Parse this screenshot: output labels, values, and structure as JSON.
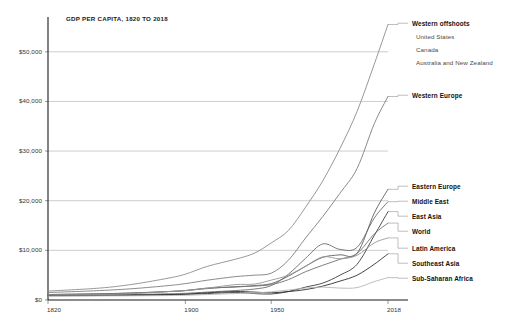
{
  "chart_data": {
    "type": "line",
    "title": "GDP PER CAPITA, 1820 TO 2018",
    "xlabel": "",
    "ylabel": "",
    "grid": true,
    "legend_position": "right",
    "xlim": [
      1820,
      2018
    ],
    "ylim": [
      0,
      56000
    ],
    "x_ticks": [
      1820,
      1900,
      1950,
      2018
    ],
    "x_tick_labels": [
      "1820",
      "1900",
      "1950",
      "2018"
    ],
    "y_ticks": [
      0,
      10000,
      20000,
      30000,
      40000,
      50000
    ],
    "y_tick_labels": [
      "$0",
      "$10,000",
      "$20,000",
      "$30,000",
      "$40,000",
      "$50,000"
    ],
    "x": [
      1820,
      1850,
      1870,
      1890,
      1900,
      1913,
      1929,
      1940,
      1950,
      1960,
      1970,
      1980,
      1990,
      2000,
      2010,
      2018
    ],
    "series": [
      {
        "name": "Western offshoots",
        "color": "#8c8c8c",
        "values": [
          1800,
          2400,
          3200,
          4400,
          5200,
          6800,
          8200,
          9400,
          11500,
          14000,
          18700,
          24000,
          30500,
          38000,
          47500,
          55500
        ]
      },
      {
        "name": "Western Europe",
        "color": "#7d7d7d",
        "values": [
          1500,
          1900,
          2300,
          2900,
          3300,
          4000,
          4700,
          5000,
          5400,
          8000,
          12500,
          16800,
          21500,
          26500,
          35500,
          41000
        ]
      },
      {
        "name": "Eastern Europe",
        "color": "#5f5f5f",
        "values": [
          1100,
          1250,
          1400,
          1700,
          1900,
          2400,
          2600,
          2900,
          3300,
          4800,
          6800,
          8600,
          9100,
          9400,
          17500,
          22300
        ]
      },
      {
        "name": "Middle East",
        "color": "#6b6b6b",
        "values": [
          900,
          1000,
          1100,
          1250,
          1350,
          1600,
          1900,
          2200,
          2900,
          5200,
          8400,
          11300,
          10200,
          10600,
          16500,
          19800
        ]
      },
      {
        "name": "East Asia",
        "color": "#3c3c3c",
        "values": [
          950,
          1000,
          1000,
          1100,
          1150,
          1300,
          1500,
          1300,
          1200,
          1700,
          2600,
          3400,
          5000,
          7200,
          13000,
          17800
        ]
      },
      {
        "name": "World",
        "color": "#707070",
        "values": [
          1100,
          1250,
          1450,
          1700,
          1900,
          2300,
          2700,
          2800,
          3100,
          4100,
          5700,
          7000,
          8200,
          9400,
          13300,
          15500
        ]
      },
      {
        "name": "Latin America",
        "color": "#969696",
        "values": [
          1000,
          1100,
          1300,
          1700,
          1900,
          2400,
          3100,
          3200,
          4000,
          5000,
          6800,
          8700,
          8300,
          9000,
          11500,
          12500
        ]
      },
      {
        "name": "Southeast Asia",
        "color": "#2e2e2e",
        "values": [
          850,
          900,
          950,
          1050,
          1150,
          1450,
          1700,
          1600,
          1450,
          1700,
          2100,
          2800,
          3800,
          5000,
          7200,
          9300
        ]
      },
      {
        "name": "Sub-Saharan Africa",
        "color": "#b5b5b5",
        "values": [
          800,
          820,
          850,
          900,
          950,
          1100,
          1300,
          1400,
          1650,
          2000,
          2400,
          2600,
          2400,
          2500,
          3700,
          4500
        ]
      }
    ]
  },
  "legend": {
    "groups": [
      {
        "label": "Western offshoots",
        "sub_items": [
          "United States",
          "Canada",
          "Australia and New Zealand"
        ]
      },
      {
        "label": "Western Europe",
        "sub_items": []
      },
      {
        "label": "Eastern Europe",
        "sub_items": []
      },
      {
        "label": "Middle East",
        "sub_items": []
      },
      {
        "label": "East Asia",
        "sub_items": []
      },
      {
        "label": "World",
        "sub_items": []
      },
      {
        "label": "Latin America",
        "sub_items": []
      },
      {
        "label": "Southeast Asia",
        "sub_items": []
      },
      {
        "label": "Sub-Saharan Africa",
        "sub_items": []
      }
    ]
  },
  "axis": {
    "y_labels": [
      "$50,000",
      "$40,000",
      "$30,000",
      "$20,000",
      "$10,000",
      "$0"
    ],
    "x_labels": [
      "1820",
      "1900",
      "1950",
      "2018"
    ]
  }
}
